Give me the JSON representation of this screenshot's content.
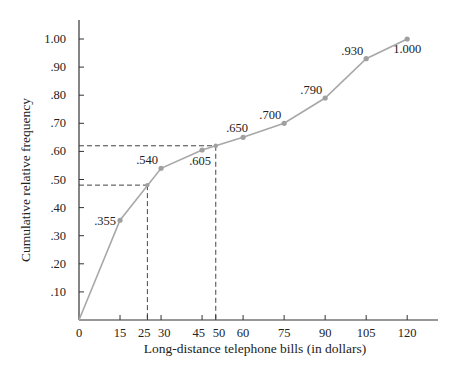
{
  "chart_data": {
    "type": "line",
    "title": "",
    "xlabel": "Long-distance telephone bills (in dollars)",
    "ylabel": "Cumulative relative frequency",
    "x": [
      0,
      15,
      30,
      45,
      60,
      75,
      90,
      105,
      120
    ],
    "series": [
      {
        "name": "Ogive",
        "values": [
          0,
          0.355,
          0.54,
          0.605,
          0.65,
          0.7,
          0.79,
          0.93,
          1.0
        ]
      }
    ],
    "point_labels": [
      {
        "x": 15,
        "y": 0.355,
        "label": ".355"
      },
      {
        "x": 30,
        "y": 0.54,
        "label": ".540"
      },
      {
        "x": 45,
        "y": 0.605,
        "label": ".605"
      },
      {
        "x": 60,
        "y": 0.65,
        "label": ".650"
      },
      {
        "x": 75,
        "y": 0.7,
        "label": ".700"
      },
      {
        "x": 90,
        "y": 0.79,
        "label": ".790"
      },
      {
        "x": 105,
        "y": 0.93,
        "label": ".930"
      },
      {
        "x": 120,
        "y": 1.0,
        "label": "1.000"
      }
    ],
    "reference_lines": [
      {
        "x": 25,
        "y": 0.48,
        "style": "dashed"
      },
      {
        "x": 50,
        "y": 0.62,
        "style": "dashed"
      }
    ],
    "xticks": [
      "0",
      "15",
      "25",
      "30",
      "45",
      "50",
      "60",
      "75",
      "90",
      "105",
      "120"
    ],
    "xtick_values": [
      0,
      15,
      25,
      30,
      45,
      50,
      60,
      75,
      90,
      105,
      120
    ],
    "yticks": [
      ".10",
      ".20",
      ".30",
      ".40",
      ".50",
      ".60",
      ".70",
      ".80",
      ".90",
      "1.00"
    ],
    "ytick_values": [
      0.1,
      0.2,
      0.3,
      0.4,
      0.5,
      0.6,
      0.7,
      0.8,
      0.9,
      1.0
    ],
    "xlim": [
      0,
      130
    ],
    "ylim": [
      0,
      1.05
    ],
    "grid": false,
    "colors": {
      "line": "#a8a8a8",
      "marker": "#a0a0a0",
      "axis": "#333333",
      "dash": "#444444"
    }
  }
}
